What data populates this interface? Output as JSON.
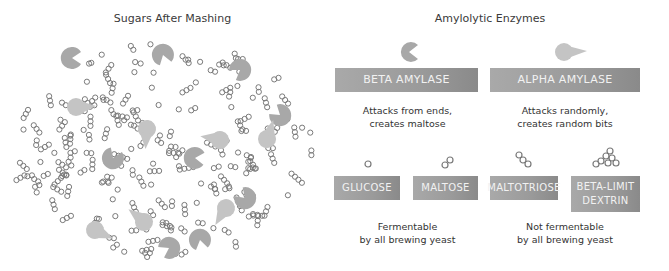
{
  "left_panel": {
    "title": "Sugars After Mashing"
  },
  "right_panel": {
    "title": "Amylolytic Enzymes",
    "enzymes": [
      {
        "label": "BETA AMYLASE",
        "icon": "pacman-shape-icon",
        "description_line1": "Attacks from ends,",
        "description_line2": "creates maltose"
      },
      {
        "label": "ALPHA AMYLASE",
        "icon": "teardrop-shape-icon",
        "description_line1": "Attacks randomly,",
        "description_line2": "creates random bits"
      }
    ],
    "sugars": [
      {
        "label": "GLUCOSE",
        "icon": "single-ring-icon"
      },
      {
        "label": "MALTOSE",
        "icon": "double-ring-icon"
      },
      {
        "label": "MALTOTRIOSE",
        "icon": "triple-ring-icon"
      },
      {
        "label_line1": "BETA-LIMIT",
        "label_line2": "DEXTRIN",
        "icon": "branched-ring-cluster-icon"
      }
    ],
    "groups": [
      {
        "line1": "Fermentable",
        "line2": "by all brewing yeast"
      },
      {
        "line1": "Not fermentable",
        "line2": "by all brewing yeast"
      }
    ]
  },
  "colors": {
    "box_gray": "#9a9a9a",
    "beta_enzyme": "#a8a8a8",
    "alpha_enzyme": "#c4c4c4",
    "ring_stroke": "#7a7a7a"
  }
}
